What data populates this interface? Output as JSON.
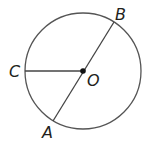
{
  "diagram": {
    "title": "",
    "circle": {
      "cx": 83,
      "cy": 71,
      "r": 58,
      "stroke": "#555555"
    },
    "center": {
      "label": "O",
      "x": 83,
      "y": 71
    },
    "points": {
      "A": {
        "label": "A",
        "x": 53,
        "y": 121
      },
      "B": {
        "label": "B",
        "x": 114,
        "y": 22
      },
      "C": {
        "label": "C",
        "x": 25,
        "y": 71
      }
    },
    "segments": [
      {
        "name": "diameter-AB",
        "from": "A",
        "to": "B"
      },
      {
        "name": "radius-OC",
        "from": "O",
        "to": "C"
      }
    ],
    "colors": {
      "line": "#444444",
      "text": "#231f20"
    }
  }
}
